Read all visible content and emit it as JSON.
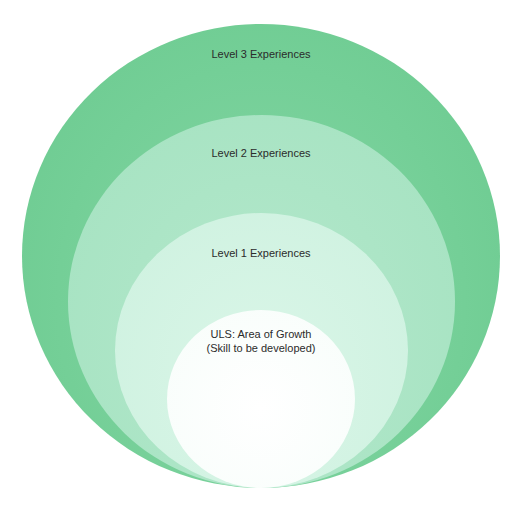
{
  "diagram": {
    "type": "nested-circles",
    "levels": [
      {
        "id": "level3",
        "label": "Level 3 Experiences",
        "color": "#74cf97"
      },
      {
        "id": "level2",
        "label": "Level 2 Experiences",
        "color": "#a4e2c0"
      },
      {
        "id": "level1",
        "label": "Level 1 Experiences",
        "color": "#cdf1df"
      },
      {
        "id": "core",
        "label_line1": "ULS: Area of Growth",
        "label_line2": "(Skill to be developed)",
        "color": "#ffffff"
      }
    ]
  }
}
